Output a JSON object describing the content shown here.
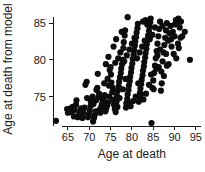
{
  "chart_data": {
    "type": "scatter",
    "title": "",
    "xlabel": "Age at death",
    "ylabel": "Age at death from model",
    "xlim": [
      61.5,
      95.5
    ],
    "ylim": [
      71.0,
      86.5
    ],
    "xticks": [
      65,
      70,
      75,
      80,
      85,
      90,
      95
    ],
    "yticks": [
      75,
      80,
      85
    ],
    "xtick_labels": [
      "65",
      "70",
      "75",
      "80",
      "85",
      "90",
      "95"
    ],
    "ytick_labels": [
      "75",
      "80",
      "85"
    ],
    "grid": false,
    "legend": null,
    "marker": "filled-circle",
    "marker_color": "#0d0d0d",
    "marker_size": 3.1,
    "n_points": 213,
    "points": [
      [
        62.2,
        71.7
      ],
      [
        64.8,
        73.3
      ],
      [
        65.0,
        72.8
      ],
      [
        65.3,
        73.1
      ],
      [
        65.6,
        73.4
      ],
      [
        65.9,
        72.9
      ],
      [
        66.1,
        73.6
      ],
      [
        66.4,
        72.3
      ],
      [
        66.6,
        73.2
      ],
      [
        66.9,
        73.9
      ],
      [
        67.0,
        74.5
      ],
      [
        67.3,
        72.2
      ],
      [
        67.6,
        72.6
      ],
      [
        67.9,
        73.0
      ],
      [
        68.1,
        73.4
      ],
      [
        68.4,
        72.1
      ],
      [
        68.6,
        72.8
      ],
      [
        68.9,
        73.5
      ],
      [
        69.1,
        76.6
      ],
      [
        69.4,
        77.0
      ],
      [
        69.5,
        74.8
      ],
      [
        69.7,
        72.2
      ],
      [
        69.9,
        72.6
      ],
      [
        70.1,
        73.1
      ],
      [
        70.3,
        73.7
      ],
      [
        70.4,
        74.2
      ],
      [
        70.6,
        74.6
      ],
      [
        70.8,
        75.0
      ],
      [
        70.9,
        71.6
      ],
      [
        71.1,
        72.1
      ],
      [
        71.3,
        72.5
      ],
      [
        71.5,
        73.0
      ],
      [
        71.7,
        75.9
      ],
      [
        71.9,
        76.2
      ],
      [
        72.0,
        78.1
      ],
      [
        72.2,
        74.9
      ],
      [
        72.4,
        73.2
      ],
      [
        72.6,
        72.8
      ],
      [
        72.8,
        73.6
      ],
      [
        73.0,
        74.0
      ],
      [
        73.2,
        74.4
      ],
      [
        73.4,
        74.8
      ],
      [
        73.6,
        75.2
      ],
      [
        73.8,
        73.0
      ],
      [
        74.0,
        73.4
      ],
      [
        74.2,
        73.8
      ],
      [
        74.4,
        74.2
      ],
      [
        74.6,
        76.5
      ],
      [
        74.8,
        78.6
      ],
      [
        75.0,
        79.0
      ],
      [
        75.2,
        76.9
      ],
      [
        75.4,
        75.6
      ],
      [
        75.6,
        74.6
      ],
      [
        75.8,
        73.9
      ],
      [
        76.0,
        73.3
      ],
      [
        76.2,
        72.9
      ],
      [
        76.4,
        74.3
      ],
      [
        76.5,
        75.1
      ],
      [
        76.7,
        75.8
      ],
      [
        76.9,
        76.4
      ],
      [
        77.0,
        77.0
      ],
      [
        77.2,
        77.6
      ],
      [
        77.4,
        78.2
      ],
      [
        77.5,
        78.8
      ],
      [
        77.7,
        79.4
      ],
      [
        77.8,
        80.0
      ],
      [
        78.0,
        81.6
      ],
      [
        78.1,
        82.4
      ],
      [
        78.3,
        83.3
      ],
      [
        78.4,
        84.0
      ],
      [
        78.6,
        73.5
      ],
      [
        78.7,
        74.1
      ],
      [
        78.9,
        74.7
      ],
      [
        79.0,
        75.3
      ],
      [
        79.2,
        75.9
      ],
      [
        79.3,
        76.5
      ],
      [
        79.5,
        77.1
      ],
      [
        79.6,
        77.7
      ],
      [
        79.8,
        78.3
      ],
      [
        79.9,
        78.9
      ],
      [
        80.1,
        79.5
      ],
      [
        80.2,
        80.1
      ],
      [
        80.4,
        80.7
      ],
      [
        80.5,
        81.3
      ],
      [
        80.7,
        81.9
      ],
      [
        80.8,
        82.5
      ],
      [
        81.0,
        83.1
      ],
      [
        81.1,
        83.7
      ],
      [
        81.3,
        84.3
      ],
      [
        81.4,
        84.9
      ],
      [
        81.6,
        74.3
      ],
      [
        81.7,
        74.9
      ],
      [
        81.9,
        75.5
      ],
      [
        82.0,
        76.1
      ],
      [
        82.2,
        76.7
      ],
      [
        82.3,
        77.3
      ],
      [
        82.5,
        77.9
      ],
      [
        82.6,
        78.5
      ],
      [
        82.8,
        79.1
      ],
      [
        82.9,
        79.7
      ],
      [
        83.1,
        80.3
      ],
      [
        83.2,
        80.9
      ],
      [
        83.4,
        81.5
      ],
      [
        83.5,
        82.1
      ],
      [
        83.7,
        82.7
      ],
      [
        83.8,
        83.3
      ],
      [
        84.0,
        83.9
      ],
      [
        84.1,
        84.5
      ],
      [
        84.3,
        85.1
      ],
      [
        84.4,
        85.6
      ],
      [
        84.6,
        71.4
      ],
      [
        84.8,
        76.2
      ],
      [
        85.0,
        77.2
      ],
      [
        85.2,
        78.2
      ],
      [
        85.4,
        79.2
      ],
      [
        85.6,
        80.2
      ],
      [
        85.8,
        81.2
      ],
      [
        86.0,
        82.2
      ],
      [
        86.2,
        83.2
      ],
      [
        86.4,
        84.2
      ],
      [
        86.6,
        85.2
      ],
      [
        86.8,
        75.8
      ],
      [
        87.0,
        76.8
      ],
      [
        87.2,
        79.8
      ],
      [
        87.4,
        81.0
      ],
      [
        87.6,
        82.0
      ],
      [
        87.8,
        83.0
      ],
      [
        88.0,
        84.0
      ],
      [
        88.2,
        85.0
      ],
      [
        88.5,
        82.6
      ],
      [
        88.8,
        83.6
      ],
      [
        89.0,
        84.6
      ],
      [
        89.3,
        81.8
      ],
      [
        89.6,
        83.8
      ],
      [
        90.0,
        84.8
      ],
      [
        90.3,
        85.4
      ],
      [
        90.6,
        85.0
      ],
      [
        90.9,
        85.6
      ],
      [
        91.2,
        84.4
      ],
      [
        91.5,
        85.2
      ],
      [
        91.8,
        83.2
      ],
      [
        92.4,
        83.8
      ],
      [
        93.6,
        80.0
      ],
      [
        73.5,
        76.8
      ],
      [
        74.3,
        77.4
      ],
      [
        75.1,
        78.0
      ],
      [
        76.1,
        79.6
      ],
      [
        76.8,
        80.2
      ],
      [
        77.3,
        81.0
      ],
      [
        78.2,
        79.8
      ],
      [
        78.8,
        80.6
      ],
      [
        79.4,
        81.4
      ],
      [
        80.0,
        82.2
      ],
      [
        80.6,
        83.0
      ],
      [
        81.2,
        80.2
      ],
      [
        81.8,
        81.0
      ],
      [
        82.4,
        81.8
      ],
      [
        83.0,
        82.6
      ],
      [
        83.6,
        84.8
      ],
      [
        84.2,
        82.8
      ],
      [
        84.8,
        83.4
      ],
      [
        85.4,
        84.4
      ],
      [
        86.0,
        80.6
      ],
      [
        86.6,
        81.4
      ],
      [
        87.2,
        84.6
      ],
      [
        88.0,
        80.8
      ],
      [
        88.6,
        79.4
      ],
      [
        89.2,
        82.8
      ],
      [
        90.0,
        83.2
      ],
      [
        90.8,
        82.2
      ],
      [
        91.4,
        83.0
      ],
      [
        71.0,
        74.0
      ],
      [
        71.6,
        74.5
      ],
      [
        72.3,
        75.4
      ],
      [
        73.1,
        75.0
      ],
      [
        74.7,
        75.0
      ],
      [
        75.5,
        76.2
      ],
      [
        76.6,
        73.6
      ],
      [
        77.1,
        74.8
      ],
      [
        77.9,
        76.0
      ],
      [
        78.5,
        77.4
      ],
      [
        79.1,
        74.2
      ],
      [
        79.7,
        73.7
      ],
      [
        80.3,
        74.4
      ],
      [
        80.9,
        75.0
      ],
      [
        81.5,
        76.8
      ],
      [
        82.1,
        75.2
      ],
      [
        82.7,
        74.6
      ],
      [
        83.3,
        75.4
      ],
      [
        84.0,
        76.6
      ],
      [
        84.5,
        78.0
      ],
      [
        85.1,
        76.0
      ],
      [
        85.7,
        78.8
      ],
      [
        86.3,
        79.0
      ],
      [
        86.9,
        78.4
      ],
      [
        87.5,
        77.8
      ],
      [
        73.9,
        79.4
      ],
      [
        74.5,
        80.4
      ],
      [
        75.7,
        81.8
      ],
      [
        76.3,
        82.8
      ],
      [
        77.6,
        83.8
      ],
      [
        79.0,
        85.8
      ],
      [
        82.6,
        85.2
      ],
      [
        83.2,
        85.4
      ],
      [
        88.2,
        79.2
      ],
      [
        89.8,
        80.8
      ],
      [
        90.4,
        80.2
      ],
      [
        91.0,
        81.6
      ]
    ]
  },
  "figure": {
    "width": 205,
    "height": 172,
    "background": "#ffffff",
    "ink_color": "#1a1a1a"
  }
}
